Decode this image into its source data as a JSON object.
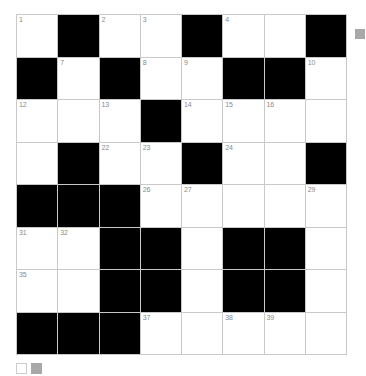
{
  "puzzle": {
    "title": "Crossword Grid",
    "rows": 8,
    "cols": 8,
    "colors": {
      "block": "#000000",
      "open": "#ffffff",
      "grid_line": "#c9c9c9",
      "number_text": "#8a8a8a",
      "swatch_gray": "#a8a8a8"
    },
    "grid": [
      [
        {
          "block": false,
          "number": "1"
        },
        {
          "block": true,
          "number": ""
        },
        {
          "block": false,
          "number": "2"
        },
        {
          "block": false,
          "number": "3"
        },
        {
          "block": true,
          "number": ""
        },
        {
          "block": false,
          "number": "4"
        },
        {
          "block": false,
          "number": ""
        },
        {
          "block": true,
          "number": ""
        }
      ],
      [
        {
          "block": true,
          "number": ""
        },
        {
          "block": false,
          "number": "7"
        },
        {
          "block": true,
          "number": ""
        },
        {
          "block": false,
          "number": "8"
        },
        {
          "block": false,
          "number": "9"
        },
        {
          "block": true,
          "number": ""
        },
        {
          "block": true,
          "number": ""
        },
        {
          "block": false,
          "number": "10"
        }
      ],
      [
        {
          "block": false,
          "number": "12"
        },
        {
          "block": false,
          "number": ""
        },
        {
          "block": false,
          "number": "13"
        },
        {
          "block": true,
          "number": ""
        },
        {
          "block": false,
          "number": "14"
        },
        {
          "block": false,
          "number": "15"
        },
        {
          "block": false,
          "number": "16"
        },
        {
          "block": false,
          "number": ""
        }
      ],
      [
        {
          "block": false,
          "number": ""
        },
        {
          "block": true,
          "number": ""
        },
        {
          "block": false,
          "number": "22"
        },
        {
          "block": false,
          "number": "23"
        },
        {
          "block": true,
          "number": ""
        },
        {
          "block": false,
          "number": "24"
        },
        {
          "block": false,
          "number": ""
        },
        {
          "block": true,
          "number": ""
        }
      ],
      [
        {
          "block": true,
          "number": ""
        },
        {
          "block": true,
          "number": ""
        },
        {
          "block": true,
          "number": ""
        },
        {
          "block": false,
          "number": "26"
        },
        {
          "block": false,
          "number": "27"
        },
        {
          "block": false,
          "number": ""
        },
        {
          "block": false,
          "number": ""
        },
        {
          "block": false,
          "number": "29"
        }
      ],
      [
        {
          "block": false,
          "number": "31"
        },
        {
          "block": false,
          "number": "32"
        },
        {
          "block": true,
          "number": ""
        },
        {
          "block": true,
          "number": ""
        },
        {
          "block": false,
          "number": ""
        },
        {
          "block": true,
          "number": ""
        },
        {
          "block": true,
          "number": ""
        },
        {
          "block": false,
          "number": ""
        }
      ],
      [
        {
          "block": false,
          "number": "35"
        },
        {
          "block": false,
          "number": ""
        },
        {
          "block": true,
          "number": ""
        },
        {
          "block": true,
          "number": ""
        },
        {
          "block": false,
          "number": ""
        },
        {
          "block": true,
          "number": ""
        },
        {
          "block": true,
          "number": ""
        },
        {
          "block": false,
          "number": ""
        }
      ],
      [
        {
          "block": true,
          "number": ""
        },
        {
          "block": true,
          "number": ""
        },
        {
          "block": true,
          "number": ""
        },
        {
          "block": false,
          "number": "37"
        },
        {
          "block": false,
          "number": ""
        },
        {
          "block": false,
          "number": "38"
        },
        {
          "block": false,
          "number": "39"
        },
        {
          "block": false,
          "number": ""
        }
      ]
    ]
  },
  "legend": {
    "empty_swatch_label": "",
    "filled_swatch_label": ""
  }
}
